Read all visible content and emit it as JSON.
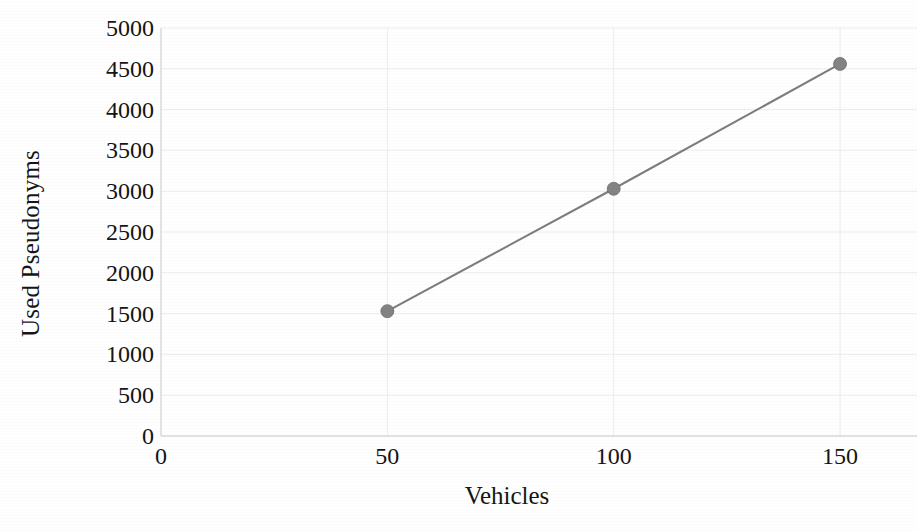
{
  "chart_data": {
    "type": "line",
    "title": "",
    "xlabel": "Vehicles",
    "ylabel": "Used Pseudonyms",
    "x": [
      50,
      100,
      150
    ],
    "values": [
      1530,
      3030,
      4560
    ],
    "series": [
      {
        "name": "Used Pseudonyms",
        "values": [
          1530,
          3030,
          4560
        ],
        "color": "#7d7d7d",
        "marker": "circle"
      }
    ],
    "xlim": [
      0,
      167
    ],
    "ylim": [
      0,
      5000
    ],
    "x_ticks": [
      0,
      50,
      100,
      150
    ],
    "x_tick_labels": [
      "0",
      "50",
      "100",
      "150"
    ],
    "y_ticks": [
      0,
      500,
      1000,
      1500,
      2000,
      2500,
      3000,
      3500,
      4000,
      4500,
      5000
    ],
    "y_tick_labels": [
      "0",
      "500",
      "1000",
      "1500",
      "2000",
      "2500",
      "3000",
      "3500",
      "4000",
      "4500",
      "5000"
    ],
    "grid": true,
    "grid_color": "#ededf0",
    "legend": false,
    "legend_position": "none",
    "axis_color": "#d9d9dd",
    "background": "#ffffff"
  },
  "figure": {
    "background_color": "#ffffff",
    "text_color": "#151515"
  }
}
